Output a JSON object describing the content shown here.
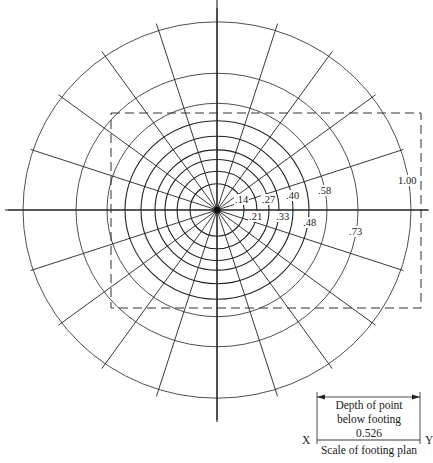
{
  "diagram": {
    "type": "influence_chart",
    "center": {
      "x": 217,
      "y": 210
    },
    "circle_radii_px": [
      27,
      40,
      52,
      62,
      76,
      92,
      110,
      141,
      194
    ],
    "radial_line_count": 20,
    "influence_labels": [
      {
        "text": ".14",
        "x": 234,
        "y": 199
      },
      {
        "text": ".21",
        "x": 248,
        "y": 216
      },
      {
        "text": ".27",
        "x": 261,
        "y": 199
      },
      {
        "text": ".33",
        "x": 275,
        "y": 216
      },
      {
        "text": ".40",
        "x": 285,
        "y": 195
      },
      {
        "text": ".48",
        "x": 302,
        "y": 222
      },
      {
        "text": ".58",
        "x": 317,
        "y": 190
      },
      {
        "text": ".73",
        "x": 348,
        "y": 231
      },
      {
        "text": "1.00",
        "x": 397,
        "y": 180
      }
    ],
    "footing_rectangle": {
      "x": 111,
      "y": 113,
      "width": 310,
      "height": 195,
      "style": "dashed"
    }
  },
  "scale_legend": {
    "depth_line1": "Depth of point",
    "depth_line2": "below footing",
    "value": "0.526",
    "left_label": "X",
    "right_label": "Y",
    "caption": "Scale of footing plan"
  }
}
